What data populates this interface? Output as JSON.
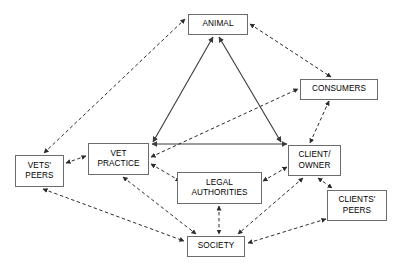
{
  "diagram": {
    "colors": {
      "background": "#ffffff",
      "node_border": "#6b6b6b",
      "node_fill": "#ffffff",
      "edge_solid": "#3a3a3a",
      "edge_dashed": "#2b2b2b",
      "text": "#000000"
    },
    "nodes": [
      {
        "id": "animal",
        "label": "ANIMAL",
        "x": 188,
        "y": 14,
        "w": 60,
        "h": 21
      },
      {
        "id": "consumers",
        "label": "CONSUMERS",
        "x": 300,
        "y": 79,
        "w": 78,
        "h": 21
      },
      {
        "id": "vet",
        "label": "VET\nPRACTICE",
        "x": 88,
        "y": 143,
        "w": 61,
        "h": 32
      },
      {
        "id": "client",
        "label": "CLIENT/\nOWNER",
        "x": 288,
        "y": 145,
        "w": 53,
        "h": 31
      },
      {
        "id": "vetspeers",
        "label": "VETS'\nPEERS",
        "x": 15,
        "y": 155,
        "w": 49,
        "h": 32
      },
      {
        "id": "legal",
        "label": "LEGAL\nAUTHORITIES",
        "x": 177,
        "y": 172,
        "w": 85,
        "h": 32
      },
      {
        "id": "cpeers",
        "label": "CLIENTS'\nPEERS",
        "x": 327,
        "y": 190,
        "w": 60,
        "h": 31
      },
      {
        "id": "society",
        "label": "SOCIETY",
        "x": 187,
        "y": 236,
        "w": 58,
        "h": 21
      }
    ],
    "edges": [
      {
        "id": "vet-animal",
        "from": "vet",
        "to": "animal",
        "style": "solid",
        "arrows": "both",
        "x1": 153,
        "y1": 142,
        "x2": 213,
        "y2": 37
      },
      {
        "id": "animal-client",
        "from": "animal",
        "to": "client",
        "style": "solid",
        "arrows": "both",
        "x1": 219,
        "y1": 37,
        "x2": 281,
        "y2": 142
      },
      {
        "id": "vet-client",
        "from": "vet",
        "to": "client",
        "style": "solid",
        "arrows": "both",
        "x1": 152,
        "y1": 144,
        "x2": 287,
        "y2": 144
      },
      {
        "id": "vetspeers-animal",
        "from": "vetspeers",
        "to": "animal",
        "style": "dashed",
        "arrows": "both",
        "x1": 44,
        "y1": 153,
        "x2": 185,
        "y2": 19
      },
      {
        "id": "animal-consumers",
        "from": "animal",
        "to": "consumers",
        "style": "dashed",
        "arrows": "both",
        "x1": 250,
        "y1": 24,
        "x2": 331,
        "y2": 77
      },
      {
        "id": "consumers-client",
        "from": "consumers",
        "to": "client",
        "style": "dashed",
        "arrows": "both",
        "x1": 329,
        "y1": 101,
        "x2": 310,
        "y2": 143
      },
      {
        "id": "vet-consumers",
        "from": "vet",
        "to": "consumers",
        "style": "dashed",
        "arrows": "both",
        "x1": 151,
        "y1": 157,
        "x2": 298,
        "y2": 89
      },
      {
        "id": "vetspeers-vet",
        "from": "vetspeers",
        "to": "vet",
        "style": "dashed",
        "arrows": "both",
        "x1": 66,
        "y1": 163,
        "x2": 86,
        "y2": 156
      },
      {
        "id": "vet-legal",
        "from": "vet",
        "to": "legal",
        "style": "dashed",
        "arrows": "both",
        "x1": 151,
        "y1": 164,
        "x2": 180,
        "y2": 181
      },
      {
        "id": "legal-client",
        "from": "legal",
        "to": "client",
        "style": "dashed",
        "arrows": "both",
        "x1": 263,
        "y1": 181,
        "x2": 287,
        "y2": 167
      },
      {
        "id": "legal-society",
        "from": "legal",
        "to": "society",
        "style": "dashed",
        "arrows": "both",
        "x1": 219,
        "y1": 206,
        "x2": 219,
        "y2": 234
      },
      {
        "id": "vetspeers-society",
        "from": "vetspeers",
        "to": "society",
        "style": "dashed",
        "arrows": "both",
        "x1": 43,
        "y1": 189,
        "x2": 184,
        "y2": 241
      },
      {
        "id": "vet-society",
        "from": "vet",
        "to": "society",
        "style": "dashed",
        "arrows": "both",
        "x1": 123,
        "y1": 177,
        "x2": 196,
        "y2": 234
      },
      {
        "id": "client-society",
        "from": "client",
        "to": "society",
        "style": "dashed",
        "arrows": "both",
        "x1": 303,
        "y1": 178,
        "x2": 238,
        "y2": 234
      },
      {
        "id": "client-cpeers",
        "from": "client",
        "to": "cpeers",
        "style": "dashed",
        "arrows": "both",
        "x1": 318,
        "y1": 178,
        "x2": 332,
        "y2": 188
      },
      {
        "id": "cpeers-society",
        "from": "cpeers",
        "to": "society",
        "style": "dashed",
        "arrows": "both",
        "x1": 326,
        "y1": 219,
        "x2": 248,
        "y2": 243
      }
    ]
  }
}
